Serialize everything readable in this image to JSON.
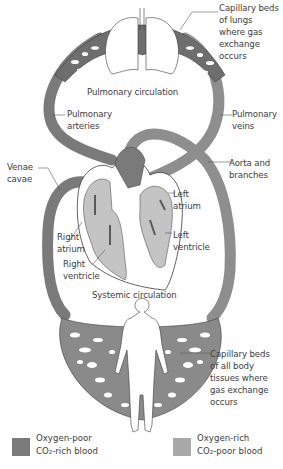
{
  "colors": {
    "oxygen_poor": "#7a7a7a",
    "oxygen_rich": "#a8a8a8",
    "heart_fill": "#c4c4c4",
    "outline": "#3a3a3a"
  },
  "labels": {
    "capillary_lungs": [
      "Capillary beds",
      "of lungs",
      "where gas",
      "exchange",
      "occurs"
    ],
    "pulmonary_circulation": "Pulmonary circulation",
    "pulmonary_arteries": [
      "Pulmonary",
      "arteries"
    ],
    "pulmonary_veins": [
      "Pulmonary",
      "veins"
    ],
    "venae_cavae": [
      "Venae",
      "cavae"
    ],
    "aorta": [
      "Aorta and",
      "branches"
    ],
    "left_atrium": [
      "Left",
      "atrium"
    ],
    "left_ventricle": [
      "Left",
      "ventricle"
    ],
    "right_atrium": [
      "Right",
      "atrium"
    ],
    "right_ventricle": [
      "Right",
      "ventricle"
    ],
    "systemic_circulation": "Systemic circulation",
    "capillary_body": [
      "Capillary beds",
      "of all body",
      "tissues where",
      "gas exchange",
      "occurs"
    ]
  },
  "legend": [
    {
      "line1": "Oxygen-poor",
      "line2": "CO₂-rich blood",
      "color_key": "oxygen_poor"
    },
    {
      "line1": "Oxygen-rich",
      "line2": "CO₂-poor blood",
      "color_key": "oxygen_rich"
    }
  ]
}
